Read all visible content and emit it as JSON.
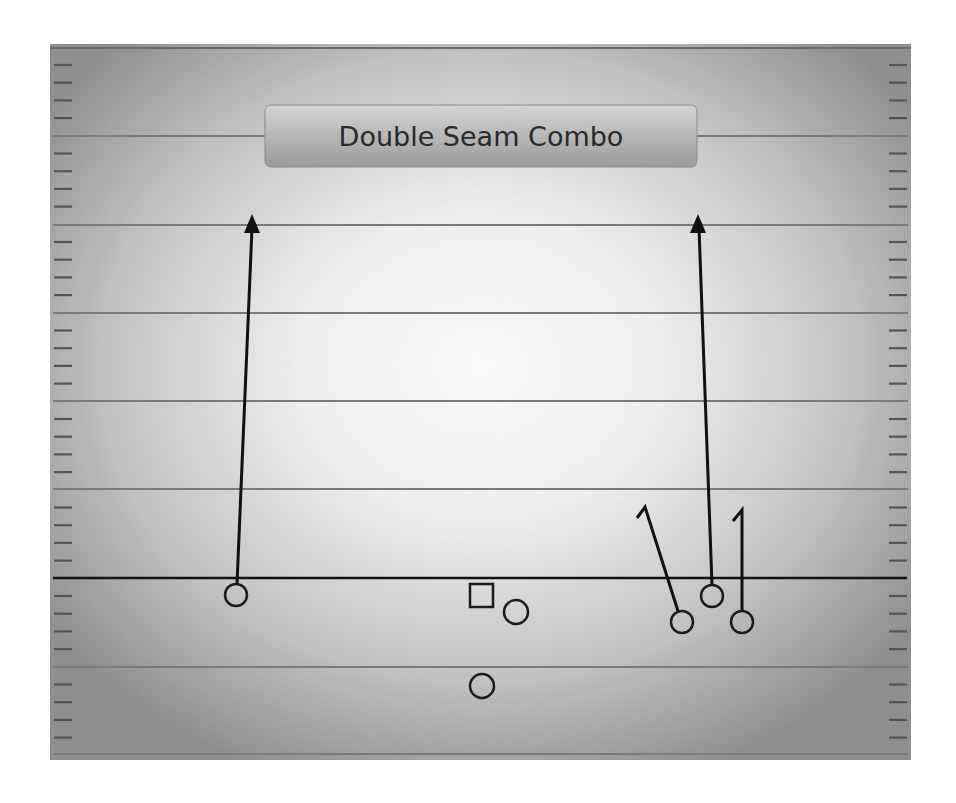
{
  "title": "Double Seam Combo",
  "colors": {
    "field_center": "#ffffff",
    "field_edge": "#8c8c8c",
    "yard_line": "#7a7a7a",
    "hash_mark": "#555555",
    "line_of_scrimmage": "#111111",
    "route": "#111111",
    "player_stroke": "#1a1a1a",
    "title_box_top": "#d2d2d2",
    "title_box_bottom": "#9c9c9c",
    "title_text": "#2a2a2a"
  },
  "field": {
    "x": 50,
    "y": 44,
    "width": 861,
    "height": 716,
    "yard_lines_y": [
      136,
      225,
      313,
      401,
      489,
      667,
      754
    ],
    "line_of_scrimmage_y": 578,
    "hash_spacing": 17.7
  },
  "title_box": {
    "x": 265,
    "y": 105,
    "width": 432,
    "height": 62
  },
  "players": [
    {
      "id": "left-receiver",
      "shape": "circle",
      "cx": 236,
      "cy": 595,
      "r": 11
    },
    {
      "id": "center",
      "shape": "square",
      "x": 470,
      "y": 584,
      "size": 23
    },
    {
      "id": "quarterback",
      "shape": "circle",
      "cx": 516,
      "cy": 612,
      "r": 12
    },
    {
      "id": "running-back",
      "shape": "circle",
      "cx": 482,
      "cy": 686,
      "r": 12
    },
    {
      "id": "slot-receiver-outer",
      "shape": "circle",
      "cx": 682,
      "cy": 622,
      "r": 11
    },
    {
      "id": "seam-receiver-right",
      "shape": "circle",
      "cx": 712,
      "cy": 596,
      "r": 11
    },
    {
      "id": "tight-end",
      "shape": "circle",
      "cx": 742,
      "cy": 622,
      "r": 11
    }
  ],
  "routes": [
    {
      "id": "left-seam-route",
      "points": "237,584 252,228",
      "arrow": {
        "tip": [
          252,
          214
        ],
        "heading": "up"
      }
    },
    {
      "id": "right-seam-route",
      "points": "712,585 699,228",
      "arrow": {
        "tip": [
          698,
          214
        ],
        "heading": "up"
      }
    },
    {
      "id": "hitch-route-slot",
      "points": "678,611 645,507 637,518",
      "arrow": null
    },
    {
      "id": "hitch-route-te",
      "points": "742,611 742,510 733,521",
      "arrow": null
    }
  ]
}
